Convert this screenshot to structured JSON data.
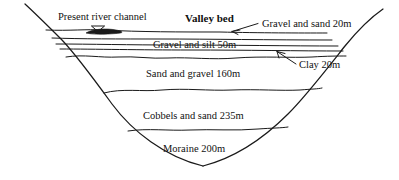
{
  "figure": {
    "type": "geological-cross-section"
  },
  "annotations": {
    "river_channel": "Present river channel",
    "valley_bed": "Valley bed"
  },
  "strata": [
    {
      "id": "gravel-sand",
      "label": "Gravel and sand  20m",
      "material": "Gravel and sand",
      "thickness": "20m",
      "callout": true
    },
    {
      "id": "gravel-silt",
      "label": "Gravel and silt  50m",
      "material": "Gravel and silt",
      "thickness": "50m",
      "callout": false
    },
    {
      "id": "clay",
      "label": "Clay  20m",
      "material": "Clay",
      "thickness": "20m",
      "callout": true
    },
    {
      "id": "sand-gravel",
      "label": "Sand and gravel  160m",
      "material": "Sand and gravel",
      "thickness": "160m",
      "callout": false
    },
    {
      "id": "cobbels-sand",
      "label": "Cobbels and sand  235m",
      "material": "Cobbels and sand",
      "thickness": "235m",
      "callout": false
    },
    {
      "id": "moraine",
      "label": "Moraine  200m",
      "material": "Moraine",
      "thickness": "200m",
      "callout": false
    }
  ],
  "icons": {
    "water_table": "water-table-triangle-icon",
    "channel": "river-channel-icon"
  },
  "colors": {
    "line": "#1a1a1a",
    "text": "#111111",
    "background": "#ffffff"
  }
}
